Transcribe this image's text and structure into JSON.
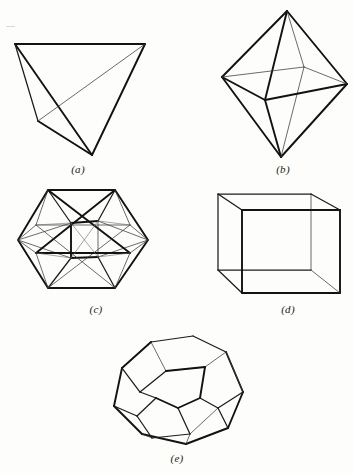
{
  "page": {
    "background_color": "#fdfdfb",
    "ink_color": "#121212",
    "width": 353,
    "height": 473
  },
  "figures": [
    {
      "id": "tetrahedron",
      "caption": "(a)",
      "name": "tetrahedron",
      "faces": 4,
      "vertices": 4,
      "edges": 6,
      "caption_x": 58,
      "caption_y": 163
    },
    {
      "id": "octahedron",
      "caption": "(b)",
      "name": "octahedron",
      "faces": 8,
      "vertices": 6,
      "edges": 12,
      "caption_x": 263,
      "caption_y": 163
    },
    {
      "id": "icosahedron",
      "caption": "(c)",
      "name": "icosahedron",
      "faces": 20,
      "vertices": 12,
      "edges": 30,
      "caption_x": 76,
      "caption_y": 303
    },
    {
      "id": "cube",
      "caption": "(d)",
      "name": "cube",
      "faces": 6,
      "vertices": 8,
      "edges": 12,
      "caption_x": 268,
      "caption_y": 303
    },
    {
      "id": "dodecahedron",
      "caption": "(e)",
      "name": "dodecahedron",
      "faces": 12,
      "vertices": 20,
      "edges": 30,
      "caption_x": 157,
      "caption_y": 452
    }
  ]
}
